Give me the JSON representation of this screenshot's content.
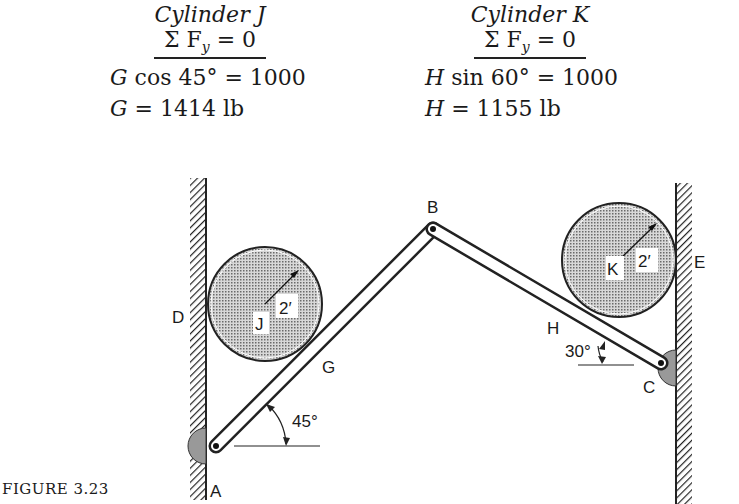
{
  "equations": {
    "cylinder_j": {
      "title": "Cylinder J",
      "sum": "Σ F",
      "sum_sub": "y",
      "sum_rhs": " = 0",
      "line1_var": "G",
      "line1_rest": " cos 45° = 1000",
      "line2_var": "G",
      "line2_rest": " = 1414 lb"
    },
    "cylinder_k": {
      "title": "Cylinder K",
      "sum": "Σ F",
      "sum_sub": "y",
      "sum_rhs": " = 0",
      "line1_var": "H",
      "line1_rest": " sin 60° = 1000",
      "line2_var": "H",
      "line2_rest": " = 1155 lb"
    }
  },
  "diagram": {
    "labels": {
      "A": "A",
      "B": "B",
      "C": "C",
      "D": "D",
      "E": "E",
      "G": "G",
      "H": "H",
      "J": "J",
      "K": "K",
      "radius_j": "2′",
      "radius_k": "2′",
      "angle_a": "45°",
      "angle_c": "30°"
    }
  },
  "caption": "FIGURE 3.23"
}
